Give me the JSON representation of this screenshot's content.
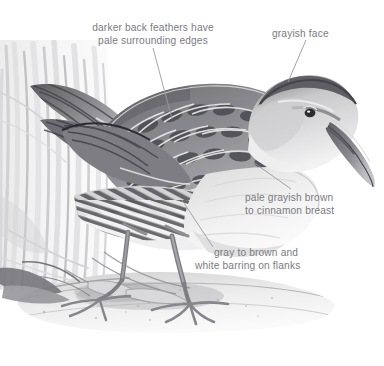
{
  "figure": {
    "medium": "graphite pencil drawing",
    "background_color": "#ffffff",
    "label_color": "#7b7b80",
    "leader_line_color": "#9a9aa0"
  },
  "annotations": [
    {
      "id": "back-feathers",
      "name": "darker-back-feathers-label",
      "line1": "darker back feathers have",
      "line2": "pale surrounding edges",
      "leader": {
        "x1": 153,
        "y1": 48,
        "x2": 172,
        "y2": 119
      }
    },
    {
      "id": "grayish-face",
      "name": "grayish-face-label",
      "line1": "grayish face",
      "line2": "",
      "leader": {
        "x1": 306,
        "y1": 40,
        "x2": 288,
        "y2": 82
      }
    },
    {
      "id": "breast",
      "name": "breast-color-label",
      "line1": "pale grayish brown",
      "line2": "to cinnamon breast",
      "leader": {
        "x1": 253,
        "y1": 162,
        "x2": 291,
        "y2": 189
      }
    },
    {
      "id": "flanks",
      "name": "flank-barring-label",
      "line1": "gray to brown and",
      "line2": "white barring on flanks",
      "leader": {
        "x1": 182,
        "y1": 200,
        "x2": 213,
        "y2": 247
      }
    }
  ],
  "illustration": {
    "parts": [
      {
        "name": "bill",
        "description": "long slightly decurved bill"
      },
      {
        "name": "head",
        "description": "grayish face with dark eye line"
      },
      {
        "name": "eye",
        "description": "dark eye with pale surround"
      },
      {
        "name": "back",
        "description": "dark back feathers with pale edges"
      },
      {
        "name": "wing",
        "description": "folded wing over flank"
      },
      {
        "name": "flank",
        "description": "black and white barred flanks"
      },
      {
        "name": "breast",
        "description": "pale grayish brown to cinnamon breast"
      },
      {
        "name": "tail",
        "description": "short cocked tail at left"
      },
      {
        "name": "legs",
        "description": "two long legs with long toes"
      },
      {
        "name": "ground",
        "description": "mud bank with pebble texture"
      },
      {
        "name": "reeds",
        "description": "vertical marsh grass background"
      }
    ]
  }
}
